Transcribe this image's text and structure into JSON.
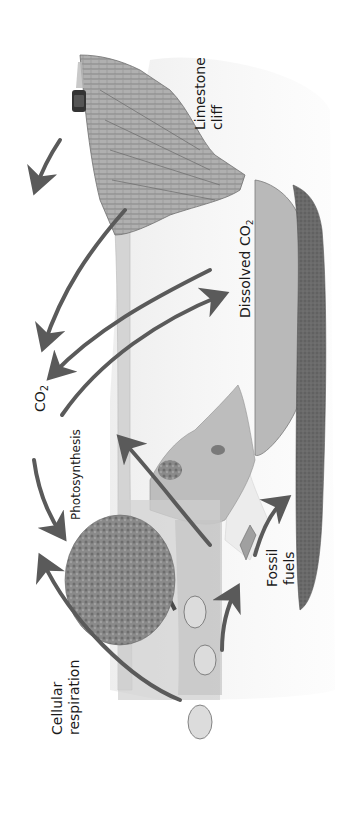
{
  "diagram": {
    "orientation": "rotated 90 degrees counter-clockwise",
    "labels": {
      "co2": "CO",
      "co2_sub": "2",
      "photosynthesis": "Photosynthesis",
      "cellular_respiration_line1": "Cellular",
      "cellular_respiration_line2": "respiration",
      "dissolved_co2": "Dissolved CO",
      "dissolved_co2_sub": "2",
      "limestone_line1": "Limestone",
      "limestone_line2": "cliff",
      "fossil_line1": "Fossil",
      "fossil_line2": "fuels"
    },
    "elements": [
      {
        "name": "limestone-cliff",
        "desc": "layered limestone cliff with a car/vehicle emitting exhaust"
      },
      {
        "name": "ocean",
        "desc": "body of water containing dissolved CO2"
      },
      {
        "name": "fossil-fuel-deposit",
        "desc": "dark underground deposit"
      },
      {
        "name": "tree",
        "desc": "large leafy tree performing photosynthesis"
      },
      {
        "name": "grazing-animals",
        "count": 3
      },
      {
        "name": "hills",
        "desc": "grassy hills with shrubs"
      },
      {
        "name": "decomposing-matter",
        "desc": "dead organism debris near fossil fuels"
      }
    ],
    "arrows": [
      {
        "name": "vehicle-exhaust-to-atmosphere"
      },
      {
        "name": "limestone-to-co2"
      },
      {
        "name": "ocean-to-co2"
      },
      {
        "name": "co2-to-ocean"
      },
      {
        "name": "co2-to-tree-photosynthesis"
      },
      {
        "name": "animals-respiration-to-co2"
      },
      {
        "name": "ground-to-hill"
      },
      {
        "name": "animals-to-fossil-fuels"
      },
      {
        "name": "decomposition-to-fossil-fuels"
      }
    ],
    "colors": {
      "arrow": "#5a5a5a",
      "ocean": "#b9b9b9",
      "fossil": "#6a6a6a",
      "ground": "#e4e4e4",
      "rock": "#9a9a9a",
      "tree": "#7a7a7a",
      "text": "#1a1a1a"
    }
  }
}
